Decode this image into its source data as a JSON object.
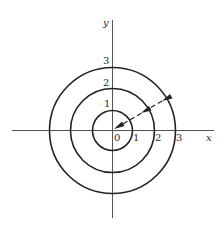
{
  "diagram": {
    "type": "concentric-circles",
    "axes": {
      "x_label": "x",
      "y_label": "y",
      "origin_label": "0"
    },
    "x_ticks": [
      "1",
      "2",
      "3"
    ],
    "y_ticks": [
      "1",
      "2",
      "3"
    ],
    "circles": [
      {
        "radius": 1
      },
      {
        "radius": 2
      },
      {
        "radius": 3
      }
    ],
    "arrow": {
      "description": "dashed arrow from outside circle of radius 3 toward origin, with arrowheads crossing each circle",
      "style": "dashed"
    },
    "colors": {
      "line": "#222222",
      "axis": "#555555",
      "background": "#ffffff"
    }
  }
}
